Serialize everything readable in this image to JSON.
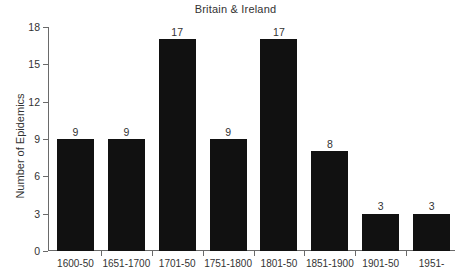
{
  "chart_data": {
    "type": "bar",
    "title": "Britain & Ireland",
    "xlabel": "",
    "ylabel": "Number of Epidemics",
    "categories": [
      "1600-50",
      "1651-1700",
      "1701-50",
      "1751-1800",
      "1801-50",
      "1851-1900",
      "1901-50",
      "1951-"
    ],
    "values": [
      9,
      9,
      17,
      9,
      17,
      8,
      3,
      3
    ],
    "ylim": [
      0,
      18
    ],
    "yticks": [
      0,
      3,
      6,
      9,
      12,
      15,
      18
    ],
    "grid": false,
    "legend": null,
    "bar_color": "#111111",
    "axis_color": "#6a6a6a",
    "background_color": "#ffffff",
    "data_labels": [
      "9",
      "9",
      "17",
      "9",
      "17",
      "8",
      "3",
      "3"
    ]
  }
}
